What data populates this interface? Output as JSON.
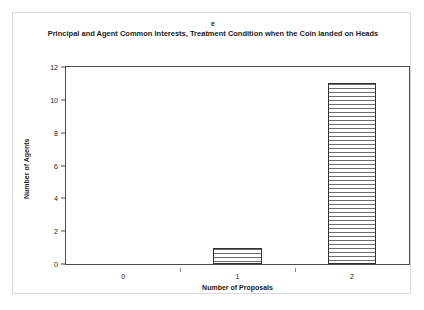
{
  "figure": {
    "panel_letter": "e",
    "title": "Principal and Agent Common Interests, Treatment Condition when the Coin landed on Heads"
  },
  "chart_data": {
    "type": "bar",
    "title": "Principal and Agent Common Interests, Treatment Condition when the Coin landed on Heads",
    "panel_label": "e",
    "categories": [
      "0",
      "1",
      "2"
    ],
    "values": [
      0,
      1,
      11
    ],
    "xlabel": "Number of Proposals",
    "ylabel": "Number of Agents",
    "ylim": [
      0,
      12
    ],
    "ytick_labels": [
      "0",
      "2",
      "4",
      "6",
      "8",
      "10",
      "12"
    ],
    "ytick_values": [
      0,
      2,
      4,
      6,
      8,
      10,
      12
    ],
    "grid": false,
    "legend": "none",
    "bar_fill": "horizontal-line-hatch",
    "bar_edge_color": "#333333",
    "axis_color": "#4d4d4d",
    "background_color": "#ffffff"
  }
}
